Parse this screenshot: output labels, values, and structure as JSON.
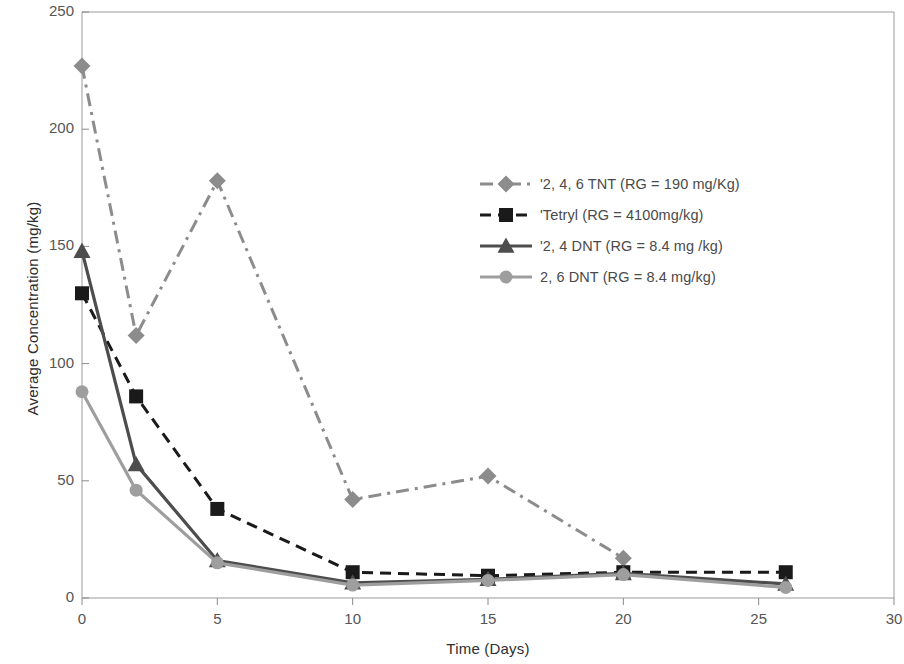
{
  "chart_data": {
    "type": "line",
    "title": "",
    "xlabel": "Time (Days)",
    "ylabel": "Average Concentration (mg/kg)",
    "xlim": [
      0,
      30
    ],
    "ylim": [
      0,
      250
    ],
    "xticks": [
      0,
      5,
      10,
      15,
      20,
      25,
      30
    ],
    "yticks": [
      0,
      50,
      100,
      150,
      200,
      250
    ],
    "xticklabels": [
      "0",
      "5",
      "10",
      "15",
      "20",
      "25",
      "30"
    ],
    "yticklabels": [
      "0",
      "50",
      "100",
      "150",
      "200",
      "250"
    ],
    "grid": false,
    "legend_position": "center-right-inside",
    "x": [
      0,
      2,
      5,
      10,
      15,
      20,
      26
    ],
    "series": [
      {
        "name": "'2, 4, 6 TNT (RG = 190 mg/Kg)",
        "values": [
          227,
          112,
          178,
          42,
          52,
          17,
          null
        ],
        "color": "#8c8c8c",
        "marker": "diamond",
        "linestyle": "dashdot"
      },
      {
        "name": "'Tetryl (RG = 4100mg/kg)",
        "values": [
          130,
          86,
          38,
          11,
          9.5,
          11,
          11
        ],
        "color": "#1a1a1a",
        "marker": "square",
        "linestyle": "dashed"
      },
      {
        "name": "'2, 4 DNT (RG = 8.4 mg /kg)",
        "values": [
          148,
          57,
          16,
          6.5,
          8,
          10.5,
          6
        ],
        "color": "#4d4d4d",
        "marker": "triangle",
        "linestyle": "solid"
      },
      {
        "name": "2, 6 DNT (RG = 8.4 mg/kg)",
        "values": [
          88,
          46,
          15,
          5.5,
          7.5,
          10,
          4.5
        ],
        "color": "#9e9e9e",
        "marker": "circle",
        "linestyle": "solid"
      }
    ]
  },
  "legend": {
    "items": [
      {
        "label": "'2, 4, 6 TNT (RG = 190 mg/Kg)"
      },
      {
        "label": "'Tetryl (RG = 4100mg/kg)"
      },
      {
        "label": "'2, 4 DNT (RG = 8.4 mg /kg)"
      },
      {
        "label": "2, 6 DNT (RG = 8.4 mg/kg)"
      }
    ]
  },
  "axes": {
    "y_title": "Average Concentration (mg/kg)",
    "x_title": "Time (Days)"
  },
  "colors": {
    "tnt": "#8c8c8c",
    "tetryl": "#1a1a1a",
    "dnt24": "#4d4d4d",
    "dnt26": "#9e9e9e",
    "frame": "#9a9a9a",
    "text": "#4a4a4a"
  }
}
